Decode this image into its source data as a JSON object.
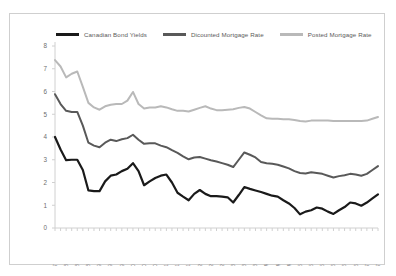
{
  "chart_data": {
    "type": "line",
    "title": "",
    "xlabel": "",
    "ylabel": "",
    "ylim": [
      0,
      8
    ],
    "ytick_step": 1,
    "yticks": [
      "0",
      "1",
      "2",
      "3",
      "4",
      "5",
      "6",
      "7",
      "8"
    ],
    "grid": false,
    "legend_position": "top",
    "colors": {
      "canadian_bond_yields": "#1a1a1a",
      "discounted_mortgage_rate": "#595959",
      "posted_mortgage_rate": "#b9b9b9",
      "axis": "#d0d0d0",
      "border": "#cfcfcf",
      "tick_label": "#6e6e6e"
    },
    "x": [
      "DEC-07",
      "FEB-08",
      "APR-08",
      "JUN-08",
      "AUG-08",
      "OCT-08",
      "DEC-08",
      "FEB-09",
      "APR-09",
      "JUN-09",
      "AUG-09",
      "OCT-09",
      "DEC-09",
      "FEB-10",
      "APR-10",
      "JUN-10",
      "AUG-10",
      "OCT-10",
      "DEC-10",
      "FEB-11",
      "APR-11",
      "JUN-11",
      "AUG-11",
      "OCT-11",
      "DEC-11",
      "FEB-12",
      "APR-12",
      "JUN-12",
      "AUG-12",
      "OCT-12",
      "DEC-12",
      "FEB-13",
      "APR-13",
      "JUN-13",
      "AUG-13",
      "OCT-13",
      "DEC-13",
      "FEB-14",
      "APR-14",
      "JUN-14",
      "AUG-14",
      "OCT-14",
      "DEC-14",
      "FEB-15",
      "APR-15",
      "JUN-15",
      "AUG-15",
      "OCT-15",
      "DEC-15",
      "FEB-16",
      "APR-16",
      "JUN-16",
      "AUG-16",
      "OCT-16",
      "DEC-16",
      "FEB-17",
      "APR-17",
      "JUN-17",
      "AUG-17"
    ],
    "xtick_labels": [
      "DEC-07",
      "APR-08",
      "AUG-08",
      "DEC-08",
      "APR-09",
      "AUG-09",
      "DEC-09",
      "APR-10",
      "AUG-10",
      "DEC-10",
      "APR-11",
      "AUG-11",
      "DEC-11",
      "APR-12",
      "AUG-12",
      "DEC-12",
      "APR-13",
      "AUG-13",
      "DEC-13",
      "APR-14",
      "AUG-14",
      "DEC-14",
      "APR-15",
      "AUG-15",
      "DEC-15",
      "APR-16",
      "AUG-16",
      "DEC-16",
      "APR-17",
      "AUG-17"
    ],
    "xtick_every": 2,
    "series": [
      {
        "name": "Canadian Bond Yields",
        "color": "#1a1a1a",
        "width": 2.2,
        "values": [
          4.0,
          3.45,
          2.98,
          3.0,
          3.0,
          2.55,
          1.65,
          1.62,
          1.62,
          2.05,
          2.3,
          2.35,
          2.5,
          2.6,
          2.85,
          2.5,
          1.88,
          2.05,
          2.2,
          2.3,
          2.35,
          2.0,
          1.55,
          1.38,
          1.22,
          1.5,
          1.67,
          1.5,
          1.4,
          1.4,
          1.38,
          1.35,
          1.12,
          1.45,
          1.8,
          1.72,
          1.65,
          1.58,
          1.5,
          1.42,
          1.38,
          1.22,
          1.08,
          0.88,
          0.6,
          0.72,
          0.78,
          0.9,
          0.85,
          0.72,
          0.62,
          0.78,
          0.92,
          1.12,
          1.08,
          0.98,
          1.12,
          1.3,
          1.48
        ]
      },
      {
        "name": "Dicounted Mortgage Rate",
        "color": "#595959",
        "width": 2.0,
        "values": [
          5.88,
          5.45,
          5.15,
          5.1,
          5.1,
          4.5,
          3.75,
          3.62,
          3.55,
          3.75,
          3.88,
          3.82,
          3.9,
          3.95,
          4.1,
          3.88,
          3.7,
          3.72,
          3.72,
          3.62,
          3.55,
          3.42,
          3.3,
          3.15,
          3.02,
          3.1,
          3.12,
          3.05,
          2.98,
          2.92,
          2.85,
          2.78,
          2.68,
          3.0,
          3.32,
          3.22,
          3.1,
          2.9,
          2.85,
          2.82,
          2.78,
          2.7,
          2.62,
          2.5,
          2.42,
          2.4,
          2.45,
          2.42,
          2.38,
          2.3,
          2.22,
          2.28,
          2.32,
          2.38,
          2.35,
          2.3,
          2.38,
          2.55,
          2.72
        ]
      },
      {
        "name": "Posted Mortgage Rate",
        "color": "#b9b9b9",
        "width": 2.0,
        "values": [
          7.38,
          7.1,
          6.62,
          6.78,
          6.88,
          6.2,
          5.5,
          5.3,
          5.2,
          5.35,
          5.42,
          5.45,
          5.45,
          5.6,
          5.98,
          5.45,
          5.25,
          5.3,
          5.3,
          5.35,
          5.3,
          5.22,
          5.15,
          5.15,
          5.12,
          5.2,
          5.28,
          5.35,
          5.25,
          5.18,
          5.18,
          5.2,
          5.22,
          5.28,
          5.32,
          5.25,
          5.1,
          4.95,
          4.82,
          4.8,
          4.8,
          4.78,
          4.78,
          4.75,
          4.7,
          4.68,
          4.72,
          4.72,
          4.72,
          4.72,
          4.7,
          4.7,
          4.7,
          4.7,
          4.7,
          4.7,
          4.72,
          4.8,
          4.88
        ]
      }
    ]
  }
}
